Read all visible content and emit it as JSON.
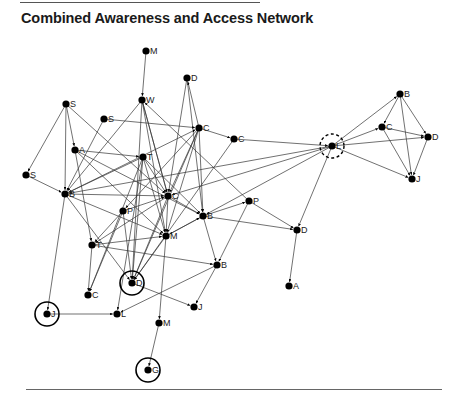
{
  "title": "Combined Awareness and Access Network",
  "nodes": [
    {
      "id": "n1",
      "label": "M",
      "x": 146,
      "y": 51
    },
    {
      "id": "n2",
      "label": "D",
      "x": 187,
      "y": 78
    },
    {
      "id": "n3",
      "label": "W",
      "x": 142,
      "y": 100
    },
    {
      "id": "n4",
      "label": "S",
      "x": 66,
      "y": 104
    },
    {
      "id": "n5",
      "label": "S",
      "x": 104,
      "y": 119
    },
    {
      "id": "n6",
      "label": "C",
      "x": 199,
      "y": 128
    },
    {
      "id": "n7",
      "label": "C",
      "x": 234,
      "y": 139
    },
    {
      "id": "n8",
      "label": "A",
      "x": 75,
      "y": 150
    },
    {
      "id": "n9",
      "label": "T",
      "x": 143,
      "y": 157
    },
    {
      "id": "n10",
      "label": "S",
      "x": 26,
      "y": 175
    },
    {
      "id": "n11",
      "label": "B",
      "x": 65,
      "y": 194
    },
    {
      "id": "n12",
      "label": "C",
      "x": 168,
      "y": 196
    },
    {
      "id": "n13",
      "label": "P",
      "x": 123,
      "y": 211
    },
    {
      "id": "n14",
      "label": "B",
      "x": 203,
      "y": 216
    },
    {
      "id": "n15",
      "label": "P",
      "x": 249,
      "y": 201
    },
    {
      "id": "n16",
      "label": "D",
      "x": 297,
      "y": 230
    },
    {
      "id": "n17",
      "label": "M",
      "x": 166,
      "y": 236
    },
    {
      "id": "n18",
      "label": "T",
      "x": 92,
      "y": 245
    },
    {
      "id": "n19",
      "label": "B",
      "x": 217,
      "y": 265
    },
    {
      "id": "n20",
      "label": "D",
      "x": 132,
      "y": 283,
      "ring": "solid"
    },
    {
      "id": "n21",
      "label": "C",
      "x": 88,
      "y": 295
    },
    {
      "id": "n22",
      "label": "J",
      "x": 47,
      "y": 314,
      "ring": "solid"
    },
    {
      "id": "n23",
      "label": "L",
      "x": 117,
      "y": 314
    },
    {
      "id": "n24",
      "label": "J",
      "x": 194,
      "y": 307
    },
    {
      "id": "n25",
      "label": "M",
      "x": 159,
      "y": 323
    },
    {
      "id": "n26",
      "label": "G",
      "x": 148,
      "y": 370,
      "ring": "solid"
    },
    {
      "id": "n27",
      "label": "A",
      "x": 289,
      "y": 286
    },
    {
      "id": "n28",
      "label": "L",
      "x": 332,
      "y": 146,
      "ring": "dashed"
    },
    {
      "id": "n29",
      "label": "B",
      "x": 400,
      "y": 94
    },
    {
      "id": "n30",
      "label": "C",
      "x": 382,
      "y": 127
    },
    {
      "id": "n31",
      "label": "D",
      "x": 428,
      "y": 137
    },
    {
      "id": "n32",
      "label": "J",
      "x": 412,
      "y": 179
    }
  ],
  "edges": [
    [
      "n1",
      "n3"
    ],
    [
      "n2",
      "n12"
    ],
    [
      "n2",
      "n14"
    ],
    [
      "n3",
      "n11"
    ],
    [
      "n3",
      "n12"
    ],
    [
      "n3",
      "n17"
    ],
    [
      "n3",
      "n20"
    ],
    [
      "n4",
      "n11"
    ],
    [
      "n4",
      "n10"
    ],
    [
      "n4",
      "n8"
    ],
    [
      "n4",
      "n12"
    ],
    [
      "n5",
      "n11"
    ],
    [
      "n5",
      "n6"
    ],
    [
      "n6",
      "n2"
    ],
    [
      "n6",
      "n7"
    ],
    [
      "n6",
      "n12"
    ],
    [
      "n6",
      "n14"
    ],
    [
      "n6",
      "n20"
    ],
    [
      "n6",
      "n17"
    ],
    [
      "n6",
      "n13"
    ],
    [
      "n7",
      "n28"
    ],
    [
      "n8",
      "n9"
    ],
    [
      "n8",
      "n14"
    ],
    [
      "n8",
      "n18"
    ],
    [
      "n8",
      "n17"
    ],
    [
      "n9",
      "n11"
    ],
    [
      "n9",
      "n12"
    ],
    [
      "n9",
      "n20"
    ],
    [
      "n9",
      "n14"
    ],
    [
      "n9",
      "n17"
    ],
    [
      "n9",
      "n21"
    ],
    [
      "n9",
      "n23"
    ],
    [
      "n10",
      "n11"
    ],
    [
      "n11",
      "n12"
    ],
    [
      "n11",
      "n17"
    ],
    [
      "n11",
      "n22"
    ],
    [
      "n11",
      "n6"
    ],
    [
      "n11",
      "n20"
    ],
    [
      "n12",
      "n14"
    ],
    [
      "n12",
      "n20"
    ],
    [
      "n12",
      "n17"
    ],
    [
      "n12",
      "n18"
    ],
    [
      "n13",
      "n12"
    ],
    [
      "n13",
      "n20"
    ],
    [
      "n13",
      "n18"
    ],
    [
      "n13",
      "n21"
    ],
    [
      "n14",
      "n15"
    ],
    [
      "n14",
      "n16"
    ],
    [
      "n14",
      "n19"
    ],
    [
      "n14",
      "n17"
    ],
    [
      "n15",
      "n16"
    ],
    [
      "n15",
      "n19"
    ],
    [
      "n15",
      "n3"
    ],
    [
      "n16",
      "n27"
    ],
    [
      "n17",
      "n14"
    ],
    [
      "n17",
      "n20"
    ],
    [
      "n17",
      "n25"
    ],
    [
      "n18",
      "n17"
    ],
    [
      "n18",
      "n19"
    ],
    [
      "n18",
      "n21"
    ],
    [
      "n19",
      "n24"
    ],
    [
      "n19",
      "n23"
    ],
    [
      "n20",
      "n24"
    ],
    [
      "n22",
      "n23"
    ],
    [
      "n25",
      "n26"
    ],
    [
      "n3",
      "n12"
    ],
    [
      "n28",
      "n29"
    ],
    [
      "n28",
      "n30"
    ],
    [
      "n28",
      "n31"
    ],
    [
      "n28",
      "n32"
    ],
    [
      "n28",
      "n16"
    ],
    [
      "n28",
      "n12"
    ],
    [
      "n28",
      "n14"
    ],
    [
      "n28",
      "n11"
    ],
    [
      "n29",
      "n30"
    ],
    [
      "n29",
      "n31"
    ],
    [
      "n29",
      "n32"
    ],
    [
      "n30",
      "n31"
    ],
    [
      "n30",
      "n32"
    ],
    [
      "n31",
      "n32"
    ],
    [
      "n7",
      "n20"
    ]
  ]
}
